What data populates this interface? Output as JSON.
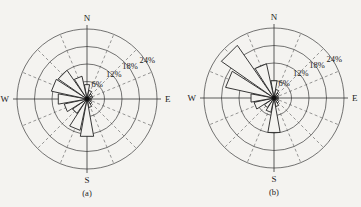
{
  "chart_data": [
    {
      "type": "wind_rose",
      "caption": "(a)",
      "directions": [
        "N",
        "NNE",
        "NE",
        "ENE",
        "E",
        "ESE",
        "SE",
        "SSE",
        "S",
        "SSW",
        "SW",
        "WSW",
        "W",
        "WNW",
        "NW",
        "NNW"
      ],
      "values": [
        5,
        3,
        2,
        2,
        1.5,
        1.5,
        2,
        3,
        13,
        11,
        6,
        8,
        10,
        12.5,
        12,
        8
      ],
      "unit": "%",
      "rings": [
        6,
        12,
        18,
        24
      ],
      "ring_labels": [
        "6%",
        "12%",
        "18%",
        "24%"
      ],
      "compass_labels": {
        "N": "N",
        "E": "E",
        "S": "S",
        "W": "W"
      },
      "center": [
        87,
        99
      ],
      "radius_px": 70
    },
    {
      "type": "wind_rose",
      "caption": "(b)",
      "directions": [
        "N",
        "NNE",
        "NE",
        "ENE",
        "E",
        "ESE",
        "SE",
        "SSE",
        "S",
        "SSW",
        "SW",
        "WSW",
        "W",
        "WNW",
        "NW",
        "NNW"
      ],
      "values": [
        6,
        3,
        2,
        1.5,
        1.5,
        1.5,
        2,
        3,
        12,
        5,
        4,
        7,
        8,
        17,
        22,
        12
      ],
      "unit": "%",
      "rings": [
        6,
        12,
        18,
        24
      ],
      "ring_labels": [
        "6%",
        "12%",
        "18%",
        "24%"
      ],
      "compass_labels": {
        "N": "N",
        "E": "E",
        "S": "S",
        "W": "W"
      },
      "center": [
        274,
        98
      ],
      "radius_px": 70
    }
  ]
}
